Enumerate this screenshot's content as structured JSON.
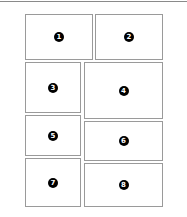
{
  "layout": {
    "title": "Panel layout diagram",
    "panels": [
      {
        "id": "1",
        "label": "1",
        "x": 25,
        "y": 14,
        "w": 68,
        "h": 46
      },
      {
        "id": "2",
        "label": "2",
        "x": 95,
        "y": 14,
        "w": 68,
        "h": 46
      },
      {
        "id": "3",
        "label": "3",
        "x": 25,
        "y": 62,
        "w": 56,
        "h": 51
      },
      {
        "id": "4",
        "label": "4",
        "x": 84,
        "y": 62,
        "w": 79,
        "h": 57
      },
      {
        "id": "5",
        "label": "5",
        "x": 25,
        "y": 115,
        "w": 56,
        "h": 41
      },
      {
        "id": "6",
        "label": "6",
        "x": 84,
        "y": 121,
        "w": 79,
        "h": 40
      },
      {
        "id": "7",
        "label": "7",
        "x": 25,
        "y": 158,
        "w": 56,
        "h": 49
      },
      {
        "id": "8",
        "label": "8",
        "x": 84,
        "y": 163,
        "w": 79,
        "h": 44
      }
    ]
  },
  "colors": {
    "border": "#9a9a9a",
    "badge_fill": "#000000",
    "badge_text": "#ffffff",
    "top_rule": "#8a8a8a"
  }
}
